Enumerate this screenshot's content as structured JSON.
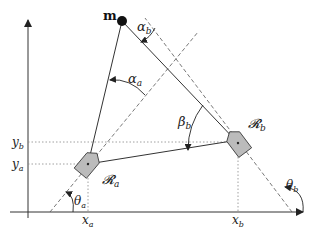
{
  "diagram": {
    "landmark": {
      "label": "m"
    },
    "robots": [
      {
        "id": "a",
        "label": "R_a",
        "display": "𝓡",
        "sub": "a",
        "x_label": "x",
        "x_sub": "a",
        "y_label": "y",
        "y_sub": "a",
        "heading_label": "θ",
        "heading_sub": "a"
      },
      {
        "id": "b",
        "label": "R_b",
        "display": "𝓡",
        "sub": "b",
        "x_label": "x",
        "x_sub": "b",
        "y_label": "y",
        "y_sub": "b",
        "heading_label": "θ",
        "heading_sub": "b"
      }
    ],
    "angles": {
      "alpha_a": {
        "sym": "α",
        "sub": "a"
      },
      "alpha_b": {
        "sym": "α",
        "sub": "b"
      },
      "beta_b": {
        "sym": "β",
        "sub": "b"
      }
    },
    "colors": {
      "line": "#333333",
      "dashed": "#555555",
      "dotted": "#888888",
      "robot_fill": "#bbbbbb",
      "landmark": "#111111"
    }
  }
}
